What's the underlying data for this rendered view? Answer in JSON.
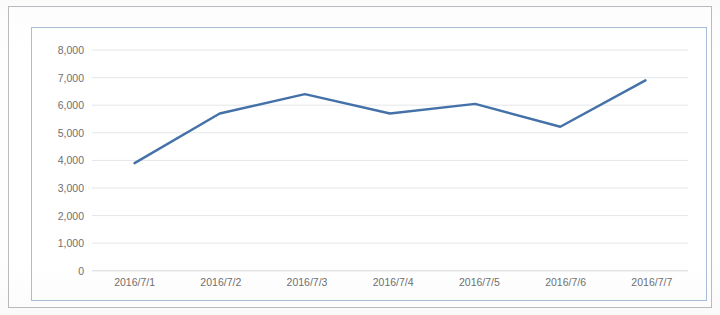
{
  "chart_data": {
    "type": "line",
    "title": "",
    "subtitle": "",
    "xlabel": "",
    "ylabel": "",
    "categories": [
      "2016/7/1",
      "2016/7/2",
      "2016/7/3",
      "2016/7/4",
      "2016/7/5",
      "2016/7/6",
      "2016/7/7"
    ],
    "series": [
      {
        "name": "",
        "values": [
          3900,
          5700,
          6400,
          5700,
          6050,
          5220,
          6900
        ],
        "color": "#4472a8"
      }
    ],
    "ylim": [
      0,
      8000
    ],
    "ytick_labels": [
      "8,000",
      "7,000",
      "6,000",
      "5,000",
      "4,000",
      "3,000",
      "2,000",
      "1,000",
      "0"
    ],
    "ytick_values": [
      8000,
      7000,
      6000,
      5000,
      4000,
      3000,
      2000,
      1000,
      0
    ],
    "grid": true,
    "grid_axis": "y",
    "legend": false,
    "legend_position": "none",
    "markers": false
  },
  "colors": {
    "series_line": "#4472a8",
    "gridline": "#e4e6e9",
    "axis_line": "#d5d7da",
    "tick_text": "#6f6f6f",
    "chart_border": "#a9bdd8",
    "page_border": "#b9bcc0",
    "plot_background": "#ffffff"
  }
}
